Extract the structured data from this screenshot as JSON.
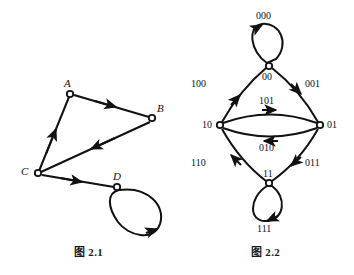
{
  "page": {
    "width": 354,
    "height": 275,
    "background": "#ffffff",
    "ink_color": "#111111"
  },
  "figures": [
    {
      "id": "figure-2-1",
      "caption": "图 2.1",
      "type": "directed-graph",
      "description": "Directed graph with four vertices A, B, C, D and a self-loop at D",
      "vertices": [
        {
          "id": "A",
          "label": "A",
          "x": 70,
          "y": 94,
          "label_x": 64,
          "label_y": 78
        },
        {
          "id": "B",
          "label": "B",
          "x": 152,
          "y": 118,
          "label_x": 157,
          "label_y": 103
        },
        {
          "id": "C",
          "label": "C",
          "x": 38,
          "y": 173,
          "label_x": 21,
          "label_y": 166
        },
        {
          "id": "D",
          "label": "D",
          "x": 117,
          "y": 187,
          "label_x": 113,
          "label_y": 171
        }
      ],
      "edges": [
        {
          "from": "A",
          "to": "B",
          "label": "",
          "kind": "straight"
        },
        {
          "from": "B",
          "to": "C",
          "label": "",
          "kind": "straight"
        },
        {
          "from": "C",
          "to": "A",
          "label": "",
          "kind": "straight"
        },
        {
          "from": "C",
          "to": "D",
          "label": "",
          "kind": "straight"
        },
        {
          "from": "D",
          "to": "D",
          "label": "",
          "kind": "self-loop"
        }
      ]
    },
    {
      "id": "figure-2-2",
      "caption": "图 2.2",
      "type": "de-bruijn-graph",
      "description": "De Bruijn graph B(2,3): vertices are 2-bit states, edges are 3-bit words",
      "vertices": [
        {
          "id": "00",
          "label": "00",
          "x": 269,
          "y": 66,
          "label_x": 262,
          "label_y": 72
        },
        {
          "id": "10",
          "label": "10",
          "x": 220,
          "y": 125,
          "label_x": 202,
          "label_y": 121
        },
        {
          "id": "01",
          "label": "01",
          "x": 320,
          "y": 125,
          "label_x": 327,
          "label_y": 121
        },
        {
          "id": "11",
          "label": "11",
          "x": 269,
          "y": 183,
          "label_x": 263,
          "label_y": 170
        }
      ],
      "edges": [
        {
          "from": "00",
          "to": "00",
          "label": "000",
          "kind": "self-loop",
          "label_x": 256,
          "label_y": 12
        },
        {
          "from": "00",
          "to": "01",
          "label": "001",
          "kind": "arc",
          "label_x": 305,
          "label_y": 80
        },
        {
          "from": "10",
          "to": "00",
          "label": "100",
          "kind": "arc",
          "label_x": 191,
          "label_y": 80
        },
        {
          "from": "10",
          "to": "01",
          "label": "101",
          "kind": "arc-upper",
          "label_x": 259,
          "label_y": 97
        },
        {
          "from": "01",
          "to": "10",
          "label": "010",
          "kind": "arc-lower",
          "label_x": 259,
          "label_y": 144
        },
        {
          "from": "01",
          "to": "11",
          "label": "011",
          "kind": "arc",
          "label_x": 305,
          "label_y": 159
        },
        {
          "from": "11",
          "to": "10",
          "label": "110",
          "kind": "arc",
          "label_x": 191,
          "label_y": 159
        },
        {
          "from": "11",
          "to": "11",
          "label": "111",
          "kind": "self-loop",
          "label_x": 257,
          "label_y": 225
        }
      ]
    }
  ]
}
